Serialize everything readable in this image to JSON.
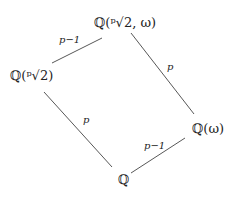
{
  "diagram": {
    "type": "field-extension-lattice",
    "nodes": {
      "top": "ℚ(ᵖ√2, ω)",
      "left": "ℚ(ᵖ√2)",
      "right": "ℚ(ω)",
      "bottom": "ℚ"
    },
    "edges": [
      {
        "from": "left",
        "to": "top",
        "label": "p−1"
      },
      {
        "from": "right",
        "to": "top",
        "label": "p"
      },
      {
        "from": "bottom",
        "to": "left",
        "label": "p"
      },
      {
        "from": "bottom",
        "to": "right",
        "label": "p−1"
      }
    ],
    "line_color": "#444444"
  }
}
